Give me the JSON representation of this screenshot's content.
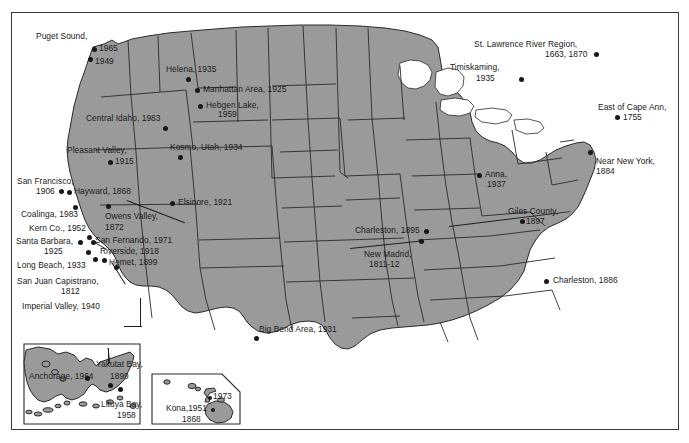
{
  "figure": {
    "type": "map",
    "region": "United States with Alaska and Hawaii insets",
    "colors": {
      "land_fill": "#9a9a9a",
      "water_fill": "#ffffff",
      "border_line": "#2a2a2a",
      "frame": "#3b3b3b",
      "label_text": "#1a1a1a",
      "marker": "#181818"
    }
  },
  "insets": [
    {
      "name": "alaska-inset",
      "label": "Alaska"
    },
    {
      "name": "hawaii-inset",
      "label": "Hawaii"
    }
  ],
  "earthquakes": [
    {
      "name": "Puget Sound",
      "label": "Puget Sound,",
      "years": "1965\n1949",
      "lines": [
        "Puget Sound,",
        "1965",
        "1949"
      ],
      "region": "conus"
    },
    {
      "name": "Helena",
      "label": "Helena, 1935",
      "lines": [
        "Helena, 1935"
      ],
      "region": "conus"
    },
    {
      "name": "Manhattan Area",
      "label": "Manhattan Area, 1925",
      "lines": [
        "Manhattan Area, 1925"
      ],
      "region": "conus"
    },
    {
      "name": "Hebgen Lake",
      "label": "Hebgen Lake,",
      "lines": [
        "Hebgen Lake,",
        "1959"
      ],
      "region": "conus"
    },
    {
      "name": "Central Idaho",
      "label": "Central Idaho, 1983",
      "lines": [
        "Central Idaho, 1983"
      ],
      "region": "conus"
    },
    {
      "name": "Kosmo Utah",
      "label": "Kosmo, Utah, 1934",
      "lines": [
        "Kosmo, Utah, 1934"
      ],
      "region": "conus"
    },
    {
      "name": "Pleasant Valley",
      "label": "Pleasant Valley,",
      "lines": [
        "Pleasant Valley,",
        "1915"
      ],
      "region": "conus"
    },
    {
      "name": "San Francisco",
      "label": "San Francisco,",
      "lines": [
        "San Francisco,",
        "1906"
      ],
      "region": "conus"
    },
    {
      "name": "Hayward",
      "label": "Hayward, 1868",
      "lines": [
        "Hayward, 1868"
      ],
      "region": "conus"
    },
    {
      "name": "Coalinga",
      "label": "Coalinga, 1983",
      "lines": [
        "Coalinga, 1983"
      ],
      "region": "conus"
    },
    {
      "name": "Kern Co.",
      "label": "Kern Co., 1952",
      "lines": [
        "Kern Co., 1952"
      ],
      "region": "conus"
    },
    {
      "name": "Owens Valley",
      "label": "Owens Valley,",
      "lines": [
        "Owens Valley,",
        "1872"
      ],
      "region": "conus"
    },
    {
      "name": "Elsinore",
      "label": "Elsinore, 1921",
      "lines": [
        "Elsinore, 1921"
      ],
      "region": "conus"
    },
    {
      "name": "San Fernando",
      "label": "San Fernando, 1971",
      "lines": [
        "San Fernando, 1971"
      ],
      "region": "conus"
    },
    {
      "name": "Santa Barbara",
      "label": "Santa Barbara,",
      "lines": [
        "Santa Barbara,",
        "1925"
      ],
      "region": "conus"
    },
    {
      "name": "Riverside",
      "label": "Riverside, 1918",
      "lines": [
        "Riverside, 1918"
      ],
      "region": "conus"
    },
    {
      "name": "Long Beach",
      "label": "Long Beach, 1933",
      "lines": [
        "Long Beach, 1933"
      ],
      "region": "conus"
    },
    {
      "name": "Hemet",
      "label": "Hemet, 1899",
      "lines": [
        "Hemet, 1899"
      ],
      "region": "conus"
    },
    {
      "name": "San Juan Capistrano",
      "label": "San Juan Capistrano,",
      "lines": [
        "San Juan Capistrano,",
        "1812"
      ],
      "region": "conus"
    },
    {
      "name": "Imperial Valley",
      "label": "Imperial Valley, 1940",
      "lines": [
        "Imperial Valley, 1940"
      ],
      "region": "conus"
    },
    {
      "name": "Big Bend Area",
      "label": "Big Bend Area, 1931",
      "lines": [
        "Big Bend Area, 1931"
      ],
      "region": "conus"
    },
    {
      "name": "Charleston Missouri",
      "label": "Charleston, 1895",
      "lines": [
        "Charleston, 1895"
      ],
      "region": "conus"
    },
    {
      "name": "New Madrid",
      "label": "New Madrid,",
      "lines": [
        "New Madrid,",
        "1811-12"
      ],
      "region": "conus"
    },
    {
      "name": "Anna",
      "label": "Anna,",
      "lines": [
        "Anna,",
        "1937"
      ],
      "region": "conus"
    },
    {
      "name": "Giles County",
      "label": "Giles County,",
      "lines": [
        "Giles County,",
        "1897"
      ],
      "region": "conus"
    },
    {
      "name": "Charleston South Carolina",
      "label": "Charleston, 1886",
      "lines": [
        "Charleston, 1886"
      ],
      "region": "conus"
    },
    {
      "name": "Timiskaming",
      "label": "Timiskaming,",
      "lines": [
        "Timiskaming,",
        "1935"
      ],
      "region": "conus"
    },
    {
      "name": "St. Lawrence River Region",
      "label": "St. Lawrence River Region,",
      "lines": [
        "St. Lawrence River Region,",
        "1663, 1870"
      ],
      "region": "conus"
    },
    {
      "name": "East of Cape Ann",
      "label": "East of Cape Ann,",
      "lines": [
        "East of Cape Ann,",
        "1755"
      ],
      "region": "conus"
    },
    {
      "name": "Near New York",
      "label": "Near New York,",
      "lines": [
        "Near New York,",
        "1884"
      ],
      "region": "conus"
    },
    {
      "name": "Anchorage",
      "label": "Anchorage, 1964",
      "lines": [
        "Anchorage, 1964"
      ],
      "region": "alaska"
    },
    {
      "name": "Yakutat Bay",
      "label": "Yakutat Bay,",
      "lines": [
        "Yakutat Bay,",
        "1899"
      ],
      "region": "alaska"
    },
    {
      "name": "Lituya Bay",
      "label": "Lituya Bay,",
      "lines": [
        "Lituya Bay,",
        "1958"
      ],
      "region": "alaska"
    },
    {
      "name": "Hawaii 1973",
      "label": "1973",
      "lines": [
        "1973"
      ],
      "region": "hawaii"
    },
    {
      "name": "Kona",
      "label": "Kona,1951",
      "lines": [
        "Kona,1951",
        "1868"
      ],
      "region": "hawaii"
    }
  ],
  "labels": {
    "puget_sound": "Puget Sound,",
    "puget_1965": "1965",
    "puget_1949": "1949",
    "helena": "Helena, 1935",
    "manhattan": "Manhattan Area, 1925",
    "hebgen_l1": "Hebgen Lake,",
    "hebgen_l2": "1959",
    "central_idaho": "Central Idaho, 1983",
    "kosmo": "Kosmo, Utah, 1934",
    "pleasant_l1": "Pleasant Valley,",
    "pleasant_l2": "1915",
    "sanfran_l1": "San Francisco,",
    "sanfran_l2": "1906",
    "hayward": "Hayward, 1868",
    "coalinga": "Coalinga, 1983",
    "kern": "Kern Co., 1952",
    "owens_l1": "Owens Valley,",
    "owens_l2": "1872",
    "elsinore": "Elsinore, 1921",
    "san_fernando": "San Fernando, 1971",
    "santa_barbara_l1": "Santa Barbara,",
    "santa_barbara_l2": "1925",
    "riverside": "Riverside, 1918",
    "long_beach": "Long Beach, 1933",
    "hemet": "Hemet, 1899",
    "capistrano_l1": "San Juan Capistrano,",
    "capistrano_l2": "1812",
    "imperial": "Imperial Valley, 1940",
    "big_bend": "Big Bend Area, 1931",
    "charleston_mo": "Charleston, 1895",
    "new_madrid_l1": "New Madrid,",
    "new_madrid_l2": "1811-12",
    "anna_l1": "Anna,",
    "anna_l2": "1937",
    "giles_l1": "Giles County,",
    "giles_l2": "1897",
    "charleston_sc": "Charleston, 1886",
    "timiskaming_l1": "Timiskaming,",
    "timiskaming_l2": "1935",
    "stlawrence_l1": "St. Lawrence River Region,",
    "stlawrence_l2": "1663, 1870",
    "cape_ann_l1": "East of Cape Ann,",
    "cape_ann_l2": "1755",
    "new_york_l1": "Near New York,",
    "new_york_l2": "1884",
    "anchorage": "Anchorage, 1964",
    "yakutat_l1": "Yakutat Bay,",
    "yakutat_l2": "1899",
    "lituya_l1": "Lituya Bay,",
    "lituya_l2": "1958",
    "hawaii_1973": "1973",
    "kona_l1": "Kona,1951",
    "kona_l2": "1868"
  }
}
